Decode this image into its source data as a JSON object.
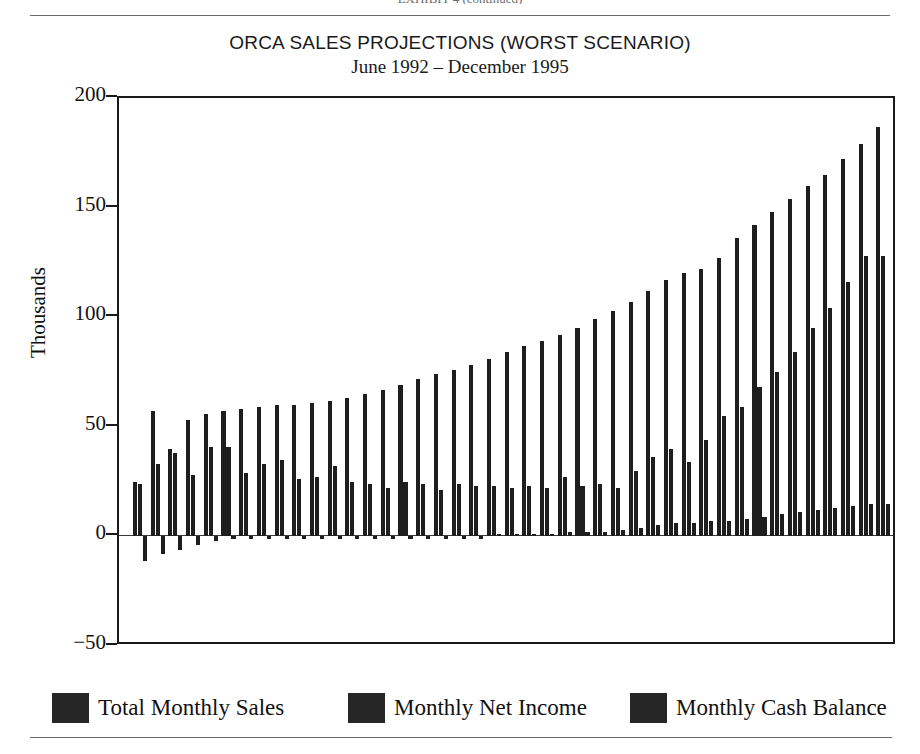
{
  "header": {
    "cropped_top_text": "EXHIBIT 4  (continued)"
  },
  "chart_data": {
    "type": "bar",
    "title": "ORCA SALES PROJECTIONS (WORST SCENARIO)",
    "subtitle": "June 1992 – December 1995",
    "xlabel": "",
    "ylabel": "Thousands",
    "ylim": [
      -50,
      200
    ],
    "yticks": [
      200,
      150,
      100,
      50,
      0,
      -50
    ],
    "ytick_labels": [
      "200",
      "150",
      "100",
      "50",
      "0",
      "−50"
    ],
    "grid": false,
    "legend_position": "bottom",
    "bar_color": "#1e1e1e",
    "categories": [
      "Jun 1992",
      "Jul 1992",
      "Aug 1992",
      "Sep 1992",
      "Oct 1992",
      "Nov 1992",
      "Dec 1992",
      "Jan 1993",
      "Feb 1993",
      "Mar 1993",
      "Apr 1993",
      "May 1993",
      "Jun 1993",
      "Jul 1993",
      "Aug 1993",
      "Sep 1993",
      "Oct 1993",
      "Nov 1993",
      "Dec 1993",
      "Jan 1994",
      "Feb 1994",
      "Mar 1994",
      "Apr 1994",
      "May 1994",
      "Jun 1994",
      "Jul 1994",
      "Aug 1994",
      "Sep 1994",
      "Oct 1994",
      "Nov 1994",
      "Dec 1994",
      "Jan 1995",
      "Feb 1995",
      "Mar 1995",
      "Apr 1995",
      "May 1995",
      "Jun 1995",
      "Jul 1995",
      "Aug 1995",
      "Sep 1995",
      "Oct 1995",
      "Nov 1995",
      "Dec 1995"
    ],
    "series": [
      {
        "name": "Total Monthly Sales",
        "values": [
          25,
          57,
          40,
          53,
          56,
          57,
          58,
          59,
          60,
          60,
          61,
          62,
          63,
          65,
          67,
          69,
          72,
          74,
          76,
          78,
          81,
          84,
          87,
          89,
          92,
          95,
          99,
          103,
          107,
          112,
          117,
          120,
          122,
          127,
          136,
          142,
          148,
          154,
          160,
          165,
          172,
          179,
          187
        ]
      },
      {
        "name": "Monthly Net Income",
        "values": [
          24,
          33,
          38,
          28,
          41,
          41,
          29,
          33,
          35,
          26,
          27,
          32,
          25,
          24,
          22,
          25,
          24,
          21,
          24,
          23,
          23,
          22,
          23,
          22,
          27,
          23,
          24,
          22,
          30,
          36,
          40,
          34,
          44,
          55,
          59,
          68,
          75,
          84,
          95,
          104,
          116,
          128,
          128
        ]
      },
      {
        "name": "Monthly Cash Balance",
        "values": [
          -11,
          -8,
          -6,
          -4,
          -2,
          -1,
          -1,
          -1,
          -1,
          -1,
          -1,
          -1,
          -1,
          -1,
          -1,
          -1,
          -1,
          -1,
          -1,
          -1,
          1,
          1,
          1,
          1,
          2,
          2,
          2,
          3,
          4,
          5,
          6,
          6,
          7,
          7,
          8,
          9,
          10,
          11,
          12,
          13,
          14,
          15,
          15
        ]
      }
    ]
  },
  "legend": {
    "items": [
      {
        "label": "Total Monthly Sales"
      },
      {
        "label": "Monthly Net Income"
      },
      {
        "label": "Monthly Cash Balance"
      }
    ]
  }
}
